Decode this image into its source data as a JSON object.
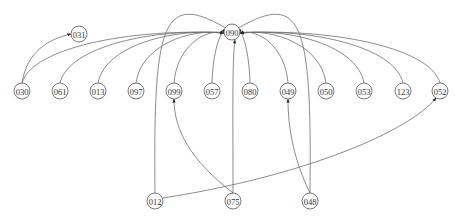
{
  "diagram": {
    "type": "directed-graph",
    "edge_color": "#6e6e6e",
    "node_stroke": "#555555",
    "hub": "090",
    "nodes": [
      {
        "id": "090",
        "x": 232,
        "y": 32
      },
      {
        "id": "031",
        "x": 79,
        "y": 34
      },
      {
        "id": "030",
        "x": 22,
        "y": 91
      },
      {
        "id": "061",
        "x": 60,
        "y": 91
      },
      {
        "id": "013",
        "x": 98,
        "y": 91
      },
      {
        "id": "097",
        "x": 136,
        "y": 91
      },
      {
        "id": "099",
        "x": 174,
        "y": 91
      },
      {
        "id": "057",
        "x": 212,
        "y": 91
      },
      {
        "id": "080",
        "x": 250,
        "y": 91
      },
      {
        "id": "049",
        "x": 288,
        "y": 91
      },
      {
        "id": "050",
        "x": 326,
        "y": 91
      },
      {
        "id": "053",
        "x": 364,
        "y": 91
      },
      {
        "id": "123",
        "x": 403,
        "y": 91
      },
      {
        "id": "052",
        "x": 440,
        "y": 91
      },
      {
        "id": "012",
        "x": 155,
        "y": 201
      },
      {
        "id": "075",
        "x": 233,
        "y": 201
      },
      {
        "id": "048",
        "x": 310,
        "y": 201
      }
    ],
    "edges": [
      {
        "from": "030",
        "to": "031"
      },
      {
        "from": "030",
        "to": "090"
      },
      {
        "from": "061",
        "to": "090"
      },
      {
        "from": "013",
        "to": "090"
      },
      {
        "from": "097",
        "to": "090"
      },
      {
        "from": "099",
        "to": "090"
      },
      {
        "from": "057",
        "to": "090"
      },
      {
        "from": "080",
        "to": "090"
      },
      {
        "from": "049",
        "to": "090"
      },
      {
        "from": "050",
        "to": "090"
      },
      {
        "from": "053",
        "to": "090"
      },
      {
        "from": "123",
        "to": "090"
      },
      {
        "from": "052",
        "to": "090"
      },
      {
        "from": "012",
        "to": "090"
      },
      {
        "from": "075",
        "to": "090"
      },
      {
        "from": "048",
        "to": "090"
      },
      {
        "from": "075",
        "to": "099"
      },
      {
        "from": "048",
        "to": "049"
      },
      {
        "from": "012",
        "to": "052"
      }
    ]
  }
}
